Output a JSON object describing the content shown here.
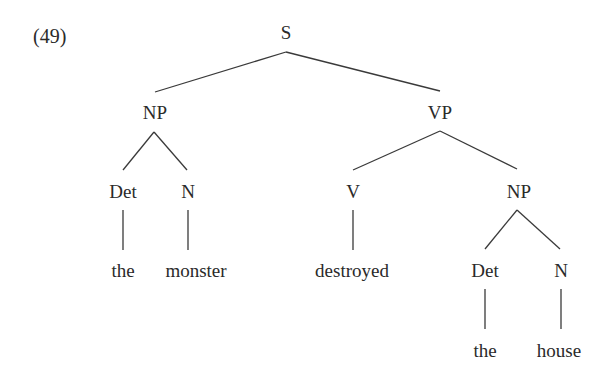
{
  "example_number": "(49)",
  "tree": {
    "root": "S",
    "nodes": {
      "s": "S",
      "np1": "NP",
      "vp": "VP",
      "det1": "Det",
      "n1": "N",
      "v": "V",
      "np2": "NP",
      "det2": "Det",
      "n2": "N"
    },
    "words": {
      "the1": "the",
      "monster": "monster",
      "destroyed": "destroyed",
      "the2": "the",
      "house": "house"
    },
    "bracketing": "[S [NP [Det the] [N monster]] [VP [V destroyed] [NP [Det the] [N house]]]]"
  },
  "style": {
    "line_color": "#3a3a3a",
    "text_color": "#2a2a2a"
  }
}
